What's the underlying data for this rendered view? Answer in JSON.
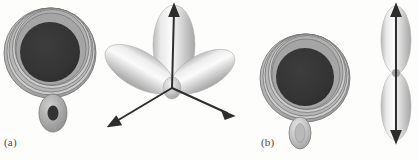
{
  "figure": {
    "background_color": "#fdfdfc",
    "panels": [
      {
        "id": "a",
        "label": "(a)"
      },
      {
        "id": "b",
        "label": "(b)"
      }
    ],
    "colors": {
      "core_dark": "#343434",
      "shell_mid": "#9d9d9d",
      "shell_light": "#c9c9c9",
      "shell_pale": "#e2e2e2",
      "outline": "#7a7a7a",
      "lobe_light": "#f2f2f2",
      "lobe_mid": "#c4c4c4",
      "lobe_shadow": "#9a9a9a",
      "arrow": "#2e2e2e",
      "label_text": "#4a4a4a"
    },
    "objects": [
      {
        "name": "s-orbital-sphere-a",
        "kind": "shelled-sphere",
        "cx": 50,
        "cy": 52,
        "r": 46,
        "core_r": 30,
        "shell_count": 5,
        "satellite": {
          "cx": 53,
          "cy": 113,
          "rx": 14,
          "ry": 19,
          "core_rx": 5,
          "core_ry": 7,
          "core_filled": true
        }
      },
      {
        "name": "p-orbital-trilobe",
        "kind": "three-lobe-orbital",
        "cx": 172,
        "cy": 88,
        "lobes": [
          {
            "name": "lobe-up",
            "angle_deg": -90,
            "length": 78,
            "width": 40,
            "arrow": true
          },
          {
            "name": "lobe-lower-left",
            "angle_deg": 150,
            "length": 72,
            "width": 36,
            "arrow": true
          },
          {
            "name": "lobe-lower-right",
            "angle_deg": 28,
            "length": 68,
            "width": 34,
            "arrow": true
          }
        ]
      },
      {
        "name": "s-orbital-sphere-b",
        "kind": "shelled-sphere",
        "cx": 305,
        "cy": 77,
        "r": 45,
        "core_r": 29,
        "shell_count": 5,
        "satellite": {
          "cx": 300,
          "cy": 133,
          "rx": 11,
          "ry": 16,
          "core_rx": 5,
          "core_ry": 9,
          "core_filled": false
        }
      },
      {
        "name": "pz-orbital-dumbbell",
        "kind": "two-lobe-orbital",
        "cx": 396,
        "cy": 73,
        "lobe_width": 28,
        "lobe_height": 64,
        "arrow": "double-headed-vertical"
      }
    ]
  }
}
